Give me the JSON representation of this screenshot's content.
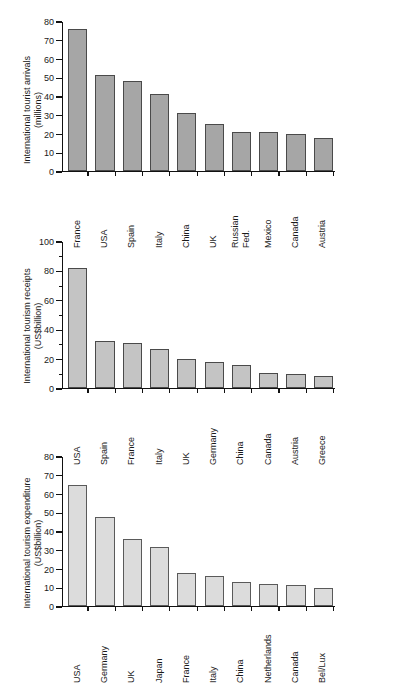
{
  "chart_data": [
    {
      "type": "bar",
      "title": "",
      "xlabel": "",
      "ylabel": "International tourist arrivals\n(millions)",
      "ylim": [
        0,
        80
      ],
      "ytick_step": 10,
      "ytick_labels": [
        "0",
        "10",
        "20",
        "30",
        "40",
        "50",
        "60",
        "70",
        "80"
      ],
      "grid": false,
      "legend": "none",
      "bar_color": "#a6a6a6",
      "bar_edge_color": "#4a4a4a",
      "categories": [
        "France",
        "USA",
        "Spain",
        "Italy",
        "China",
        "UK",
        "Russian\nFed.",
        "Mexico",
        "Canada",
        "Austria"
      ],
      "values": [
        76.0,
        51.0,
        47.9,
        41.0,
        31.2,
        24.9,
        20.6,
        20.6,
        19.7,
        17.5
      ]
    },
    {
      "type": "bar",
      "title": "",
      "xlabel": "",
      "ylabel": "International tourism receipts\n(US$billion)",
      "ylim": [
        0,
        100
      ],
      "ytick_step": 20,
      "ytick_labels": [
        "0",
        "20",
        "40",
        "60",
        "80",
        "100"
      ],
      "grid": false,
      "legend": "none",
      "bar_color": "#c4c4c4",
      "bar_edge_color": "#4a4a4a",
      "categories": [
        "USA",
        "Spain",
        "France",
        "Italy",
        "UK",
        "Germany",
        "China",
        "Canada",
        "Austria",
        "Greece"
      ],
      "values": [
        81.7,
        32.0,
        30.6,
        26.6,
        19.8,
        17.8,
        15.7,
        10.5,
        9.4,
        8.3
      ]
    },
    {
      "type": "bar",
      "title": "",
      "xlabel": "",
      "ylabel": "International tourism expenditure\n(US$billion)",
      "ylim": [
        0,
        80
      ],
      "ytick_step": 10,
      "ytick_labels": [
        "0",
        "10",
        "20",
        "30",
        "40",
        "50",
        "60",
        "70",
        "80"
      ],
      "grid": false,
      "legend": "none",
      "bar_color": "#dcdcdc",
      "bar_edge_color": "#5a5a5a",
      "categories": [
        "USA",
        "Germany",
        "UK",
        "Japan",
        "France",
        "Italy",
        "China",
        "Netherlands",
        "Canada",
        "Bel/Lux"
      ],
      "values": [
        64.6,
        47.7,
        35.8,
        31.5,
        17.6,
        15.8,
        12.6,
        11.5,
        11.4,
        9.4
      ]
    }
  ]
}
